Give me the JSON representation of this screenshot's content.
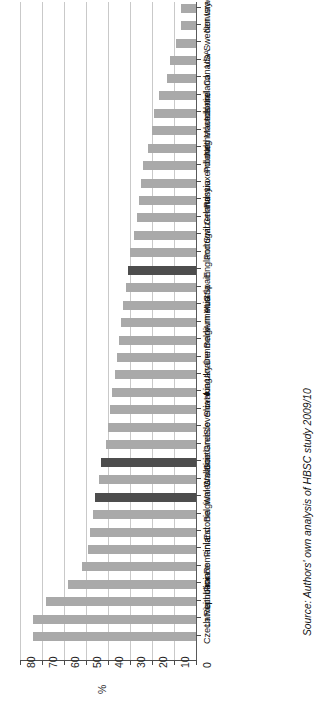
{
  "axis": {
    "x_title": "%",
    "ticks": [
      "80",
      "70",
      "60",
      "50",
      "40",
      "30",
      "20",
      "10",
      "0"
    ]
  },
  "source": {
    "note": "Source: Authors' own analysis of HBSC study 2009/10"
  },
  "colors": {
    "bar_default": "#a9a9a9",
    "bar_highlight": "#4d4d4d",
    "gridline": "#c9c9c9",
    "axis": "#4a4a4a"
  },
  "chart_data": {
    "type": "bar",
    "orientation": "horizontal",
    "title": "",
    "subtitle": "",
    "xlabel": "%",
    "ylabel": "",
    "xlim": [
      0,
      80
    ],
    "x_reversed": true,
    "grid": true,
    "legend": false,
    "highlight_color": "#4d4d4d",
    "default_color": "#a9a9a9",
    "highlighted": [
      "England",
      "Scotland",
      "Wales"
    ],
    "categories": [
      "Israel",
      "Norway",
      "Sweden",
      "USA",
      "Canada",
      "Ireland",
      "Iceland",
      "Macedonia",
      "Netherlands",
      "Poland",
      "Luxembourg",
      "Russia",
      "Germany",
      "Switzerland",
      "Portugal",
      "England",
      "Spain",
      "Austria",
      "Armenia",
      "Belgium VLG",
      "Denmark",
      "Ukraine",
      "Hungary",
      "Slovakia",
      "Slovenia",
      "Greece",
      "Scotland",
      "Croatia",
      "Wales",
      "Belgium Wallonie",
      "Estonia",
      "Finland",
      "Romania",
      "France",
      "Lithuania",
      "Latvia",
      "Czech Republic"
    ],
    "values": [
      7,
      7,
      9,
      12,
      13,
      17,
      19,
      20,
      22,
      24,
      25,
      26,
      27,
      28,
      30,
      31,
      32,
      33,
      34,
      35,
      36,
      37,
      38,
      39,
      40,
      41,
      43,
      44,
      46,
      47,
      48,
      49,
      52,
      58,
      68,
      74,
      74
    ]
  }
}
